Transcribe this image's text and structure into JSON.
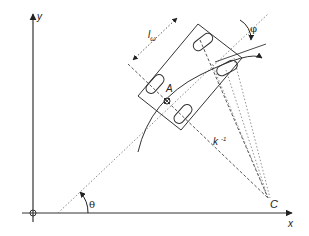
{
  "diagram": {
    "axes": {
      "x_label": "x",
      "y_label": "y"
    },
    "points": {
      "rear_axle_center": "A",
      "instantaneous_center": "C"
    },
    "labels": {
      "wheelbase": "l",
      "wheelbase_sub": "ω",
      "steering_angle": "φ",
      "heading_angle": "θ",
      "curvature_radius": "k",
      "curvature_exp": "-1"
    },
    "colors": {
      "line": "#333333",
      "background": "#ffffff"
    }
  }
}
